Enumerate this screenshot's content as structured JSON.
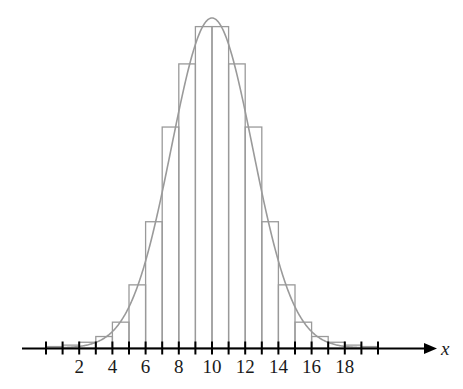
{
  "figure": {
    "title": "",
    "axis_label_x": "x",
    "axis_color": "#000000",
    "data_color": "#9a9a9a"
  },
  "chart_data": {
    "type": "bar",
    "title": "",
    "xlabel": "x",
    "ylabel": "",
    "grid": false,
    "legend": null,
    "axis": {
      "x_min": 0,
      "x_max": 21,
      "x_tick_step": 1,
      "x_tick_labels": [
        "2",
        "4",
        "6",
        "8",
        "10",
        "12",
        "14",
        "16",
        "18"
      ],
      "x_labeled_values": [
        2,
        4,
        6,
        8,
        10,
        12,
        14,
        16,
        18
      ],
      "arrow_head": true,
      "y_axis_visible": false
    },
    "bin_width": 1,
    "categories": [
      "0-1",
      "1-2",
      "2-3",
      "3-4",
      "4-5",
      "5-6",
      "6-7",
      "7-8",
      "8-9",
      "9-10",
      "10-11",
      "11-12",
      "12-13",
      "13-14",
      "14-15",
      "15-16",
      "16-17",
      "17-18",
      "18-19",
      "19-20"
    ],
    "bin_starts": [
      0,
      1,
      2,
      3,
      4,
      5,
      6,
      7,
      8,
      9,
      10,
      11,
      12,
      13,
      14,
      15,
      16,
      17,
      18,
      19
    ],
    "values": [
      0.5,
      1.0,
      2.0,
      4.0,
      9.0,
      22.0,
      44.0,
      77.0,
      99.0,
      112.0,
      112.0,
      99.0,
      77.0,
      44.0,
      22.0,
      9.0,
      4.0,
      2.0,
      1.0,
      0.5
    ],
    "overlay_curve": {
      "type": "line",
      "name": "normal density",
      "mean": 10,
      "std_dev": 2.45,
      "peak_value": 115.0
    }
  },
  "ticks": {
    "count": 21,
    "values": [
      0,
      1,
      2,
      3,
      4,
      5,
      6,
      7,
      8,
      9,
      10,
      11,
      12,
      13,
      14,
      15,
      16,
      17,
      18,
      19,
      20
    ]
  }
}
